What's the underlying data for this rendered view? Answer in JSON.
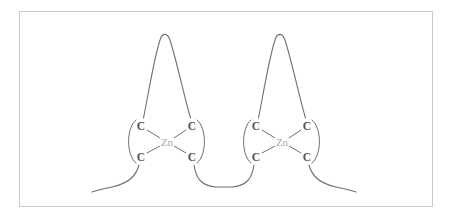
{
  "figure": {
    "background_color": "#ffffff",
    "frame_color": "#c9c9c9",
    "line_color": "#6f6f6f",
    "atom_label_color": "#545454",
    "metal_label_color": "#a9a9a9"
  },
  "atoms": {
    "metal_symbol": "Zn",
    "ligand_symbol": "C",
    "left_site": {
      "metal": {
        "label": "Zn",
        "x": 167,
        "y": 142
      },
      "ligands": [
        {
          "label": "C",
          "x": 141,
          "y": 126,
          "position": "upper-left"
        },
        {
          "label": "C",
          "x": 192,
          "y": 126,
          "position": "upper-right"
        },
        {
          "label": "C",
          "x": 141,
          "y": 157,
          "position": "lower-left"
        },
        {
          "label": "C",
          "x": 192,
          "y": 157,
          "position": "lower-right"
        }
      ]
    },
    "right_site": {
      "metal": {
        "label": "Zn",
        "x": 282,
        "y": 142
      },
      "ligands": [
        {
          "label": "C",
          "x": 256,
          "y": 126,
          "position": "upper-left"
        },
        {
          "label": "C",
          "x": 307,
          "y": 126,
          "position": "upper-right"
        },
        {
          "label": "C",
          "x": 256,
          "y": 157,
          "position": "lower-left"
        },
        {
          "label": "C",
          "x": 307,
          "y": 157,
          "position": "lower-right"
        }
      ]
    }
  },
  "loops": {
    "left_peak": {
      "x": 164,
      "y": 32
    },
    "right_peak": {
      "x": 279,
      "y": 32
    },
    "linker_bottom_y": 188
  },
  "counts": {
    "metal_centers": 2,
    "ligands_per_center": 4,
    "total_ligands": 8
  }
}
